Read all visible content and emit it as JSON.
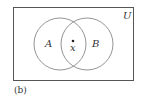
{
  "diagram": {
    "universe_label": "U",
    "set_a_label": "A",
    "set_b_label": "B",
    "element_label": "x",
    "caption": "(b)",
    "stroke_color": "#7a7a7a",
    "text_color": "#333333"
  }
}
